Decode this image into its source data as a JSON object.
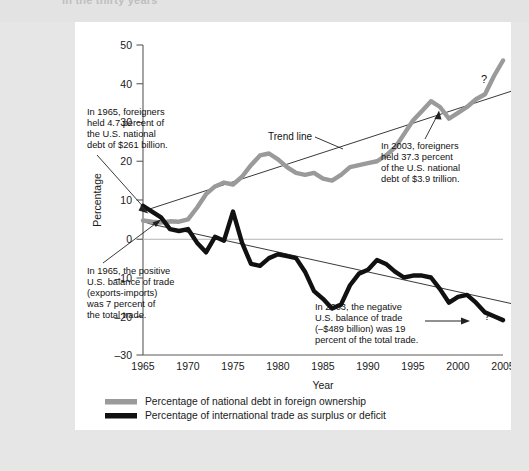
{
  "page": {
    "cutoff_text_top": "In the thirty years"
  },
  "figure": {
    "bg_color": "#ffffff",
    "page_bg_color": "#e6e6e6"
  },
  "chart_data": {
    "type": "line",
    "title": "",
    "xlabel": "Year",
    "ylabel": "Percentage",
    "xlim": [
      1965,
      2005
    ],
    "ylim": [
      -30,
      50
    ],
    "xticks": [
      1965,
      1970,
      1975,
      1980,
      1985,
      1990,
      1995,
      2000,
      2005
    ],
    "yticks": [
      -30,
      -20,
      -10,
      0,
      10,
      20,
      30,
      40,
      50
    ],
    "ytick_labels": [
      "–30",
      "–20",
      "–10",
      "0",
      "10",
      "20",
      "30",
      "40",
      "50"
    ],
    "grid": false,
    "zero_line": true,
    "legend_position": "below",
    "colors": {
      "national_debt": "#9a9a9a",
      "trade_balance": "#111111",
      "trend_line": "#222222",
      "axis": "#555555"
    },
    "series": [
      {
        "name": "Percentage of national debt in foreign ownership",
        "color": "#9a9a9a",
        "x": [
          1965,
          1966,
          1967,
          1968,
          1969,
          1970,
          1971,
          1972,
          1973,
          1974,
          1975,
          1976,
          1977,
          1978,
          1979,
          1980,
          1981,
          1982,
          1983,
          1984,
          1985,
          1986,
          1987,
          1988,
          1989,
          1990,
          1991,
          1992,
          1993,
          1994,
          1995,
          1996,
          1997,
          1998,
          1999,
          2000,
          2001,
          2002,
          2003,
          2004,
          2005
        ],
        "values": [
          4.7,
          4.4,
          4.2,
          4.5,
          4.4,
          5.0,
          8.0,
          11.5,
          13.5,
          14.5,
          14.0,
          16.0,
          19.0,
          21.5,
          22.0,
          20.5,
          18.5,
          17.0,
          16.5,
          17.0,
          15.5,
          15.0,
          16.5,
          18.5,
          19.0,
          19.5,
          20.0,
          21.5,
          23.5,
          27.0,
          30.5,
          33.0,
          35.5,
          34.0,
          31.0,
          32.5,
          34.0,
          36.0,
          37.3,
          42.0,
          46.0
        ]
      },
      {
        "name": "Percentage of international trade as surplus or deficit",
        "color": "#111111",
        "x": [
          1965,
          1966,
          1967,
          1968,
          1969,
          1970,
          1971,
          1972,
          1973,
          1974,
          1975,
          1976,
          1977,
          1978,
          1979,
          1980,
          1981,
          1982,
          1983,
          1984,
          1985,
          1986,
          1987,
          1988,
          1989,
          1990,
          1991,
          1992,
          1993,
          1994,
          1995,
          1996,
          1997,
          1998,
          1999,
          2000,
          2001,
          2002,
          2003,
          2004,
          2005
        ],
        "values": [
          8.5,
          7.0,
          5.5,
          2.5,
          2.0,
          2.5,
          -1.0,
          -3.5,
          0.5,
          -0.5,
          7.0,
          -1.0,
          -6.5,
          -7.0,
          -5.0,
          -4.0,
          -4.5,
          -5.0,
          -8.5,
          -13.5,
          -15.5,
          -18.0,
          -17.0,
          -12.0,
          -9.0,
          -8.0,
          -5.5,
          -6.5,
          -8.5,
          -10.0,
          -9.5,
          -9.5,
          -10.0,
          -13.0,
          -16.5,
          -15.0,
          -14.5,
          -16.5,
          -19.0,
          -20.0,
          -21.0
        ]
      }
    ],
    "trend_lines": [
      {
        "name": "national-debt-trend",
        "x": [
          1965.5,
          2004.5
        ],
        "y": [
          7.5,
          37.0
        ],
        "arrow_end": true,
        "end_marker": "?"
      },
      {
        "name": "trade-balance-trend",
        "x": [
          1965.5,
          2004.5
        ],
        "y": [
          4.0,
          -16.0
        ],
        "arrow_end": false,
        "end_marker": "?"
      }
    ],
    "annotations": [
      {
        "id": "anno-debt-1965",
        "lines": [
          "In 1965, foreigners",
          "held 4.7 percent of",
          "the U.S. national",
          "debt of $261 billion."
        ],
        "points_to": "1965 gray series start"
      },
      {
        "id": "anno-trade-1965",
        "lines": [
          "In 1965, the positive",
          "U.S. balance of trade",
          "(exports-imports)",
          "was 7 percent of",
          "the total trade."
        ],
        "points_to": "1965 black series start"
      },
      {
        "id": "anno-debt-2003",
        "lines": [
          "In 2003, foreigners",
          "held 37.3 percent",
          "of the U.S. national",
          "debt of $3.9 trillion."
        ],
        "points_to": "2003 gray series point"
      },
      {
        "id": "anno-trade-2003",
        "lines": [
          "In 2003, the negative",
          "U.S. balance of trade",
          "(–$489 billion) was 19",
          "percent of the total trade."
        ],
        "points_to": "2003 black series point"
      },
      {
        "id": "anno-trend-label",
        "lines": [
          "Trend line"
        ],
        "points_to": "upper trend line"
      }
    ],
    "question_marks": [
      "?",
      "?"
    ],
    "legend": [
      {
        "label": "Percentage of national debt in foreign ownership",
        "color": "#9a9a9a"
      },
      {
        "label": "Percentage of international trade as surplus or deficit",
        "color": "#111111"
      }
    ]
  }
}
